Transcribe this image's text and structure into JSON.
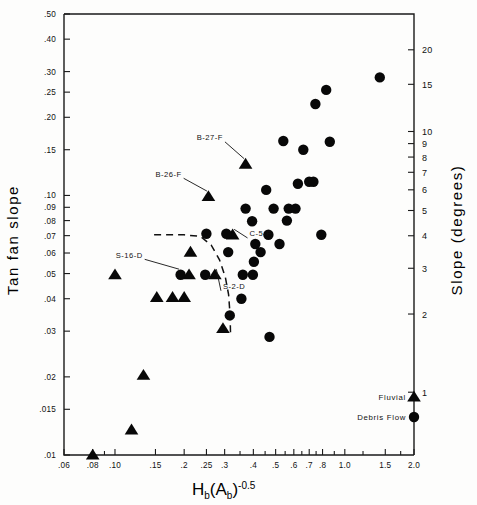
{
  "figure": {
    "name": "fan-slope-vs-basin-ruggedness-scatter",
    "background": "#fdfdfc",
    "ink": "#0a0a0a"
  },
  "axes": {
    "left": {
      "title": "Tan fan slope",
      "scale": "log",
      "range": [
        0.01,
        0.5
      ],
      "ticks": [
        {
          "value": 0.5,
          "label": ".50"
        },
        {
          "value": 0.4,
          "label": ".40"
        },
        {
          "value": 0.3,
          "label": ".30"
        },
        {
          "value": 0.25,
          "label": ".25"
        },
        {
          "value": 0.2,
          "label": ".20"
        },
        {
          "value": 0.15,
          "label": ".15"
        },
        {
          "value": 0.1,
          "label": ".10"
        },
        {
          "value": 0.09,
          "label": ".09"
        },
        {
          "value": 0.08,
          "label": ".08"
        },
        {
          "value": 0.07,
          "label": ".07"
        },
        {
          "value": 0.06,
          "label": ".06"
        },
        {
          "value": 0.05,
          "label": ".05"
        },
        {
          "value": 0.04,
          "label": ".04"
        },
        {
          "value": 0.03,
          "label": ".03"
        },
        {
          "value": 0.02,
          "label": ".02"
        },
        {
          "value": 0.015,
          "label": ".015"
        },
        {
          "value": 0.01,
          "label": ".01"
        }
      ]
    },
    "right": {
      "title": "Slope (degrees)",
      "scale": "log",
      "unit": "degrees",
      "ticks": [
        {
          "value": 20,
          "label": "20"
        },
        {
          "value": 15,
          "label": "15"
        },
        {
          "value": 10,
          "label": "10"
        },
        {
          "value": 9,
          "label": "9"
        },
        {
          "value": 8,
          "label": "8"
        },
        {
          "value": 7,
          "label": "7"
        },
        {
          "value": 6,
          "label": "6"
        },
        {
          "value": 5,
          "label": "5"
        },
        {
          "value": 4,
          "label": "4"
        },
        {
          "value": 3,
          "label": "3"
        },
        {
          "value": 2,
          "label": "2"
        },
        {
          "value": 1,
          "label": "1"
        }
      ]
    },
    "bottom": {
      "title_main": "H",
      "title_sub1": "b",
      "title_paren_open": "(A",
      "title_sub2": "b",
      "title_paren_close": ")",
      "title_exp": "-0.5",
      "title_plain": "Hb(Ab)-0.5",
      "scale": "log",
      "range": [
        0.06,
        2.0
      ],
      "ticks": [
        {
          "value": 0.06,
          "label": ".06"
        },
        {
          "value": 0.08,
          "label": ".08"
        },
        {
          "value": 0.1,
          "label": ".10"
        },
        {
          "value": 0.15,
          "label": ".15"
        },
        {
          "value": 0.2,
          "label": ".2"
        },
        {
          "value": 0.25,
          "label": ".25"
        },
        {
          "value": 0.3,
          "label": ".3"
        },
        {
          "value": 0.4,
          "label": ".4"
        },
        {
          "value": 0.5,
          "label": ".5"
        },
        {
          "value": 0.6,
          "label": ".6"
        },
        {
          "value": 0.7,
          "label": ".7"
        },
        {
          "value": 0.8,
          "label": ".8"
        },
        {
          "value": 1.0,
          "label": "1.0"
        },
        {
          "value": 1.5,
          "label": "1.5"
        },
        {
          "value": 2.0,
          "label": "2.0"
        }
      ],
      "minor_ticks": [
        0.09,
        0.35,
        0.45,
        0.55,
        0.65,
        0.75,
        0.9,
        1.2,
        1.75
      ]
    }
  },
  "legend": {
    "position": "lower-right",
    "items": [
      {
        "label": "Fluvial",
        "marker": "triangle-marker",
        "series": "fluvial"
      },
      {
        "label": "Debris Flow",
        "marker": "circle-marker",
        "series": "debris_flow"
      }
    ]
  },
  "annotations": [
    {
      "text": "B-27-F",
      "target_x": 0.37,
      "target_y": 0.132,
      "label_x": 0.295,
      "label_y": 0.163
    },
    {
      "text": "B-26-F",
      "target_x": 0.255,
      "target_y": 0.099,
      "label_x": 0.195,
      "label_y": 0.118
    },
    {
      "text": "C-5-F",
      "target_x": 0.325,
      "target_y": 0.0705,
      "label_x": 0.385,
      "label_y": 0.0695
    },
    {
      "text": "S-16-D",
      "target_x": 0.193,
      "target_y": 0.0495,
      "label_x": 0.132,
      "label_y": 0.0575
    },
    {
      "text": "S-2-D",
      "target_x": 0.272,
      "target_y": 0.0495,
      "label_x": 0.295,
      "label_y": 0.0435
    }
  ],
  "envelope": {
    "name": "fluvial-debris-flow-envelope",
    "style": "dashed",
    "points": [
      [
        0.148,
        0.0705
      ],
      [
        0.2,
        0.0705
      ],
      [
        0.235,
        0.0695
      ],
      [
        0.262,
        0.0645
      ],
      [
        0.285,
        0.0565
      ],
      [
        0.302,
        0.0485
      ],
      [
        0.312,
        0.0415
      ],
      [
        0.317,
        0.0345
      ],
      [
        0.318,
        0.0295
      ]
    ]
  },
  "chart_data": {
    "type": "scatter",
    "title": "",
    "xlabel": "Hb(Ab)-0.5",
    "ylabel": "Tan fan slope",
    "y2label": "Slope (degrees)",
    "xscale": "log",
    "yscale": "log",
    "xlim": [
      0.06,
      2.0
    ],
    "ylim": [
      0.01,
      0.5
    ],
    "grid": false,
    "legend_position": "lower right",
    "series": [
      {
        "name": "Fluvial",
        "marker": "triangle",
        "color": "#080808",
        "points": [
          [
            0.08,
            0.01
          ],
          [
            0.118,
            0.0125
          ],
          [
            0.133,
            0.0203
          ],
          [
            0.1,
            0.0495
          ],
          [
            0.152,
            0.0405
          ],
          [
            0.178,
            0.0405
          ],
          [
            0.2,
            0.0405
          ],
          [
            0.21,
            0.0495
          ],
          [
            0.213,
            0.0605
          ],
          [
            0.272,
            0.0495
          ],
          [
            0.295,
            0.0307
          ],
          [
            0.255,
            0.099
          ],
          [
            0.325,
            0.0705
          ],
          [
            0.37,
            0.132
          ]
        ]
      },
      {
        "name": "Debris Flow",
        "marker": "circle",
        "color": "#080808",
        "points": [
          [
            0.193,
            0.0495
          ],
          [
            0.247,
            0.0495
          ],
          [
            0.25,
            0.0712
          ],
          [
            0.305,
            0.0712
          ],
          [
            0.311,
            0.0605
          ],
          [
            0.316,
            0.0345
          ],
          [
            0.355,
            0.04
          ],
          [
            0.36,
            0.0495
          ],
          [
            0.37,
            0.089
          ],
          [
            0.395,
            0.0795
          ],
          [
            0.398,
            0.0495
          ],
          [
            0.402,
            0.0555
          ],
          [
            0.408,
            0.065
          ],
          [
            0.43,
            0.0605
          ],
          [
            0.455,
            0.105
          ],
          [
            0.465,
            0.0705
          ],
          [
            0.47,
            0.0285
          ],
          [
            0.49,
            0.089
          ],
          [
            0.52,
            0.065
          ],
          [
            0.54,
            0.162
          ],
          [
            0.56,
            0.08
          ],
          [
            0.57,
            0.089
          ],
          [
            0.61,
            0.089
          ],
          [
            0.625,
            0.111
          ],
          [
            0.66,
            0.15
          ],
          [
            0.7,
            0.113
          ],
          [
            0.73,
            0.113
          ],
          [
            0.745,
            0.225
          ],
          [
            0.79,
            0.0705
          ],
          [
            0.83,
            0.255
          ],
          [
            0.86,
            0.161
          ],
          [
            1.42,
            0.285
          ]
        ]
      }
    ]
  }
}
